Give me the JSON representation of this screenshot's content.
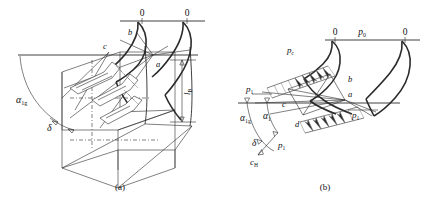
{
  "figure": {
    "panels": [
      {
        "id": "a",
        "caption": "(a)",
        "description": "three-dimensional isometric view of blade cascade with flow arrows",
        "labels": {
          "zero_left": "0",
          "zero_right": "0",
          "point_b": "b",
          "point_c": "c",
          "point_a": "a",
          "alpha_1g": "α",
          "alpha_1g_sub": "1g",
          "delta": "δ",
          "height_l": "l",
          "height_l_sub": "B"
        }
      },
      {
        "id": "b",
        "caption": "(b)",
        "description": "two-dimensional cascade section with pressure distribution combs",
        "labels": {
          "zero_left": "0",
          "zero_right": "0",
          "p_0": "p",
          "p_0_sub": "0",
          "p_c": "p",
          "p_c_sub": "c",
          "p_1_left": "p",
          "p_1_left_sub": "1",
          "p_1_lower": "p",
          "p_1_lower_sub": "1",
          "p_1_right": "p",
          "p_1_right_sub": "1",
          "alpha_1g": "α",
          "alpha_1g_sub": "1g",
          "alpha_1": "α",
          "alpha_1_sub": "1",
          "delta": "δ",
          "c_H": "c",
          "c_H_sub": "H",
          "point_a": "a",
          "point_b": "b",
          "point_c": "c",
          "point_d": "d"
        }
      }
    ],
    "colors": {
      "line": "#2b2b2b",
      "faint": "#555555",
      "background": "#ffffff"
    }
  }
}
